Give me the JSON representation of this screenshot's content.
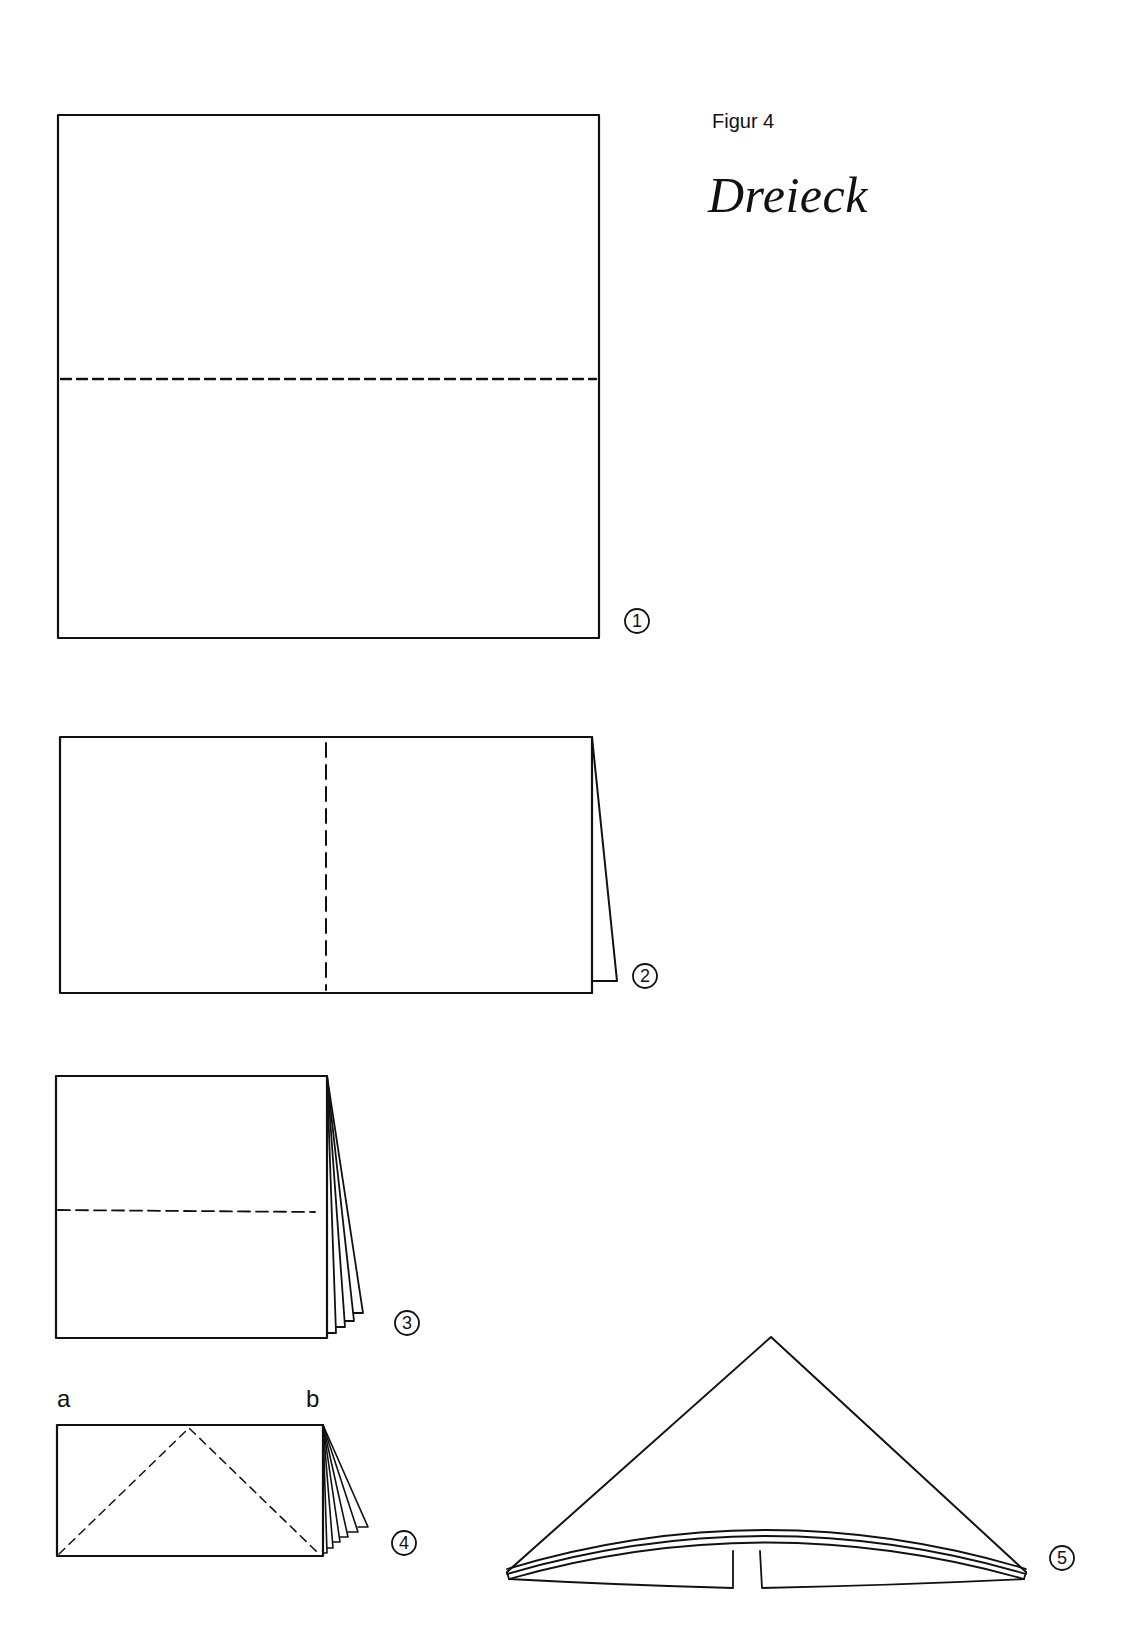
{
  "header": {
    "figure_label": "Figur 4",
    "title": "Dreieck"
  },
  "steps": [
    {
      "number": "1",
      "description": "square sheet with horizontal dashed fold line at middle"
    },
    {
      "number": "2",
      "description": "folded in half, vertical dashed fold line at middle"
    },
    {
      "number": "3",
      "description": "folded again, horizontal dashed fold line"
    },
    {
      "number": "4",
      "description": "folded rectangle with diagonal dashed fold lines from corners to top center"
    },
    {
      "number": "5",
      "description": "finished triangle (Dreieck) shape"
    }
  ],
  "corner_labels": {
    "a": "a",
    "b": "b"
  },
  "colors": {
    "line": "#111111",
    "background": "#ffffff"
  }
}
